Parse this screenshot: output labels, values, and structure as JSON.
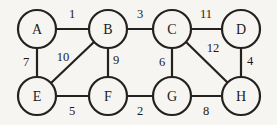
{
  "figure": {
    "kind": "undirected-weighted-graph",
    "background_color": "#f7f5f2",
    "stroke_color": "#24211f",
    "text_color": "#1c1a19",
    "width": 277,
    "height": 125
  },
  "nodes": [
    {
      "id": "A",
      "label": "A",
      "cx": 37,
      "cy": 29,
      "r": 19
    },
    {
      "id": "B",
      "label": "B",
      "cx": 108,
      "cy": 29,
      "r": 19
    },
    {
      "id": "C",
      "label": "C",
      "cx": 172,
      "cy": 29,
      "r": 19
    },
    {
      "id": "D",
      "label": "D",
      "cx": 241,
      "cy": 29,
      "r": 19
    },
    {
      "id": "E",
      "label": "E",
      "cx": 37,
      "cy": 96,
      "r": 19
    },
    {
      "id": "F",
      "label": "F",
      "cx": 108,
      "cy": 96,
      "r": 19
    },
    {
      "id": "G",
      "label": "G",
      "cx": 172,
      "cy": 96,
      "r": 19
    },
    {
      "id": "H",
      "label": "H",
      "cx": 241,
      "cy": 96,
      "r": 19
    }
  ],
  "edges": [
    {
      "from": "A",
      "to": "B",
      "weight": "1",
      "x1": 56,
      "y1": 29,
      "x2": 89,
      "y2": 29,
      "lx": 72,
      "ly": 14
    },
    {
      "from": "B",
      "to": "C",
      "weight": "3",
      "x1": 127,
      "y1": 29,
      "x2": 153,
      "y2": 29,
      "lx": 140,
      "ly": 14
    },
    {
      "from": "C",
      "to": "D",
      "weight": "11",
      "x1": 191,
      "y1": 29,
      "x2": 222,
      "y2": 29,
      "lx": 206,
      "ly": 14
    },
    {
      "from": "A",
      "to": "E",
      "weight": "7",
      "x1": 37,
      "y1": 48,
      "x2": 37,
      "y2": 77,
      "lx": 26,
      "ly": 62
    },
    {
      "from": "B",
      "to": "E",
      "weight": "10",
      "x1": 94,
      "y1": 42,
      "x2": 51,
      "y2": 83,
      "lx": 63,
      "ly": 57
    },
    {
      "from": "B",
      "to": "F",
      "weight": "9",
      "x1": 108,
      "y1": 48,
      "x2": 108,
      "y2": 77,
      "lx": 116,
      "ly": 60
    },
    {
      "from": "C",
      "to": "G",
      "weight": "6",
      "x1": 172,
      "y1": 48,
      "x2": 172,
      "y2": 77,
      "lx": 162,
      "ly": 62
    },
    {
      "from": "C",
      "to": "H",
      "weight": "12",
      "x1": 186,
      "y1": 42,
      "x2": 228,
      "y2": 83,
      "lx": 213,
      "ly": 48
    },
    {
      "from": "D",
      "to": "H",
      "weight": "4",
      "x1": 241,
      "y1": 48,
      "x2": 241,
      "y2": 77,
      "lx": 250,
      "ly": 61
    },
    {
      "from": "E",
      "to": "F",
      "weight": "5",
      "x1": 56,
      "y1": 96,
      "x2": 89,
      "y2": 96,
      "lx": 72,
      "ly": 111
    },
    {
      "from": "F",
      "to": "G",
      "weight": "2",
      "x1": 127,
      "y1": 96,
      "x2": 153,
      "y2": 96,
      "lx": 140,
      "ly": 111
    },
    {
      "from": "G",
      "to": "H",
      "weight": "8",
      "x1": 191,
      "y1": 96,
      "x2": 222,
      "y2": 96,
      "lx": 206,
      "ly": 111
    }
  ]
}
